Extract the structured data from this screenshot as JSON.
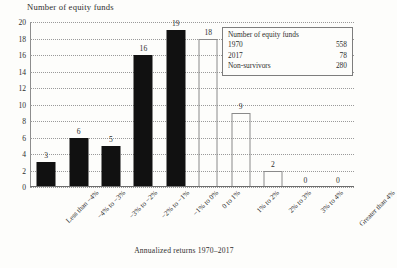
{
  "chart_data": {
    "type": "bar",
    "title": "",
    "ylabel": "Number of equity funds",
    "xlabel": "Annualized returns 1970–2017",
    "ylim": [
      0,
      20
    ],
    "ytick_step": 2,
    "yticks": [
      "20",
      "18",
      "16",
      "14",
      "12",
      "10",
      "8",
      "6",
      "4",
      "2",
      "0"
    ],
    "grid": true,
    "legend": "none",
    "categories": [
      "Less than −4%",
      "−4% to −3%",
      "−3% to −2%",
      "−2% to −1%",
      "−1% to 0%",
      "0 to 1%",
      "1% to 2%",
      "2% to 3%",
      "3% to 4%",
      "Greater than 4%"
    ],
    "values": [
      3,
      6,
      5,
      16,
      19,
      18,
      9,
      2,
      0,
      0
    ],
    "value_labels": [
      "3",
      "6",
      "5",
      "16",
      "19",
      "18",
      "9",
      "2",
      "0",
      "0"
    ],
    "bar_styles": [
      "filled",
      "filled",
      "filled",
      "filled",
      "filled",
      "open",
      "open",
      "open",
      "open",
      "open"
    ],
    "colors": {
      "filled_bar": "#111111",
      "open_bar_outline": "#8a8a8a",
      "gridline": "#9a9a9a",
      "axis": "#6d6d6d",
      "text": "#2e2e2e",
      "background": "#fdfdfb"
    }
  },
  "inset": {
    "title": "Number of equity funds",
    "rows": [
      {
        "label": "1970",
        "value": "558"
      },
      {
        "label": "2017",
        "value": "78"
      },
      {
        "label": "Non-survivors",
        "value": "280"
      }
    ]
  }
}
